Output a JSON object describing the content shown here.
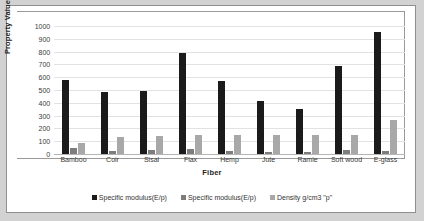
{
  "chart_data": {
    "type": "bar",
    "title": "",
    "xlabel": "Fiber",
    "ylabel": "Property Value",
    "ylim": [
      0,
      1000
    ],
    "ystep": 100,
    "grid": true,
    "legend_position": "bottom",
    "categories": [
      "Bamboo",
      "Coir",
      "Sisal",
      "Flax",
      "Hemp",
      "Jute",
      "Ramie",
      "Soft wood",
      "E-glass"
    ],
    "yticks": [
      "1000",
      "900",
      "800",
      "700",
      "600",
      "500",
      "400",
      "300",
      "200",
      "100",
      "0"
    ],
    "series": [
      {
        "name": "Specific modulus(E/p)",
        "color": "#1b1b1b",
        "values": [
          575,
          485,
          495,
          790,
          570,
          415,
          355,
          690,
          955
        ]
      },
      {
        "name": "Specific modulus(E/p)",
        "color": "#7d7d7d",
        "values": [
          50,
          25,
          30,
          38,
          22,
          12,
          18,
          30,
          20
        ]
      },
      {
        "name": "Density g/cm3 \"p\"",
        "color": "#a8a8a8",
        "values": [
          85,
          130,
          140,
          145,
          145,
          145,
          145,
          150,
          265
        ]
      }
    ]
  },
  "colors": {
    "series_1": "#1b1b1b",
    "series_2": "#7d7d7d",
    "series_3": "#a8a8a8",
    "page_background": "#d2d2d2",
    "card_background": "#ffffff",
    "gridline": "#e2e2e2",
    "axis": "#9a9a9a"
  }
}
